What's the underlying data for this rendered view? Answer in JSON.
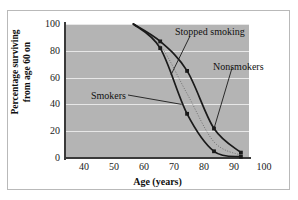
{
  "figure": {
    "top_fragment_text": "",
    "background_color": "#ffffff",
    "frame_color": "#b9b9b9",
    "plot_background_color": "#b4b4b4",
    "gridline_color": "#e7e7e7",
    "curve_color": "#1a1a1a",
    "axis_color": "#3a3a3a"
  },
  "chart_data": {
    "type": "line",
    "title": "",
    "xlabel": "Age (years)",
    "ylabel": "Percentage surviving from age 60 on",
    "ylabel_line1": "Percentage surviving",
    "ylabel_line2": "from age 60 on",
    "xlim": [
      35,
      103
    ],
    "ylim": [
      0,
      100
    ],
    "xticks": [
      40,
      50,
      60,
      70,
      80,
      90,
      100
    ],
    "xtick_labels": [
      "40",
      "50",
      "60",
      "70",
      "80",
      "90",
      "100"
    ],
    "yticks": [
      0,
      20,
      40,
      60,
      80,
      100
    ],
    "ytick_labels": [
      "0",
      "20",
      "40",
      "60",
      "80",
      "100"
    ],
    "grid": true,
    "grid_axis": "y",
    "legend": "annotations",
    "legend_position": "in-plot-callouts",
    "marker": "square",
    "series": [
      {
        "name": "Nonsmokers",
        "x": [
          60,
          70,
          80,
          90,
          100
        ],
        "values": [
          100,
          87,
          65,
          22,
          4
        ],
        "annotation": "Nonsmokers"
      },
      {
        "name": "Smokers",
        "x": [
          60,
          70,
          80,
          90,
          100
        ],
        "values": [
          100,
          82,
          33,
          5,
          1
        ],
        "annotation": "Smokers"
      },
      {
        "name": "Stopped smoking",
        "x": [
          60,
          70,
          80,
          90,
          100
        ],
        "values": [
          100,
          84,
          48,
          12,
          2
        ],
        "annotation": "Stopped smoking",
        "style": "dotted-intermediate"
      }
    ],
    "annotations": [
      {
        "text": "Stopped smoking",
        "target_x": 74,
        "target_y": 62
      },
      {
        "text": "Nonsmokers",
        "target_x": 90,
        "target_y": 22
      },
      {
        "text": "Smokers",
        "target_x": 78,
        "target_y": 40
      }
    ]
  }
}
